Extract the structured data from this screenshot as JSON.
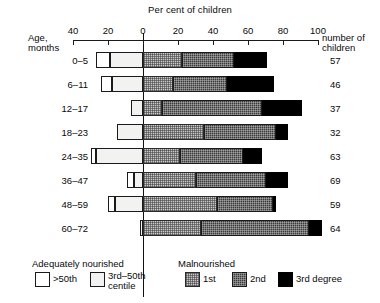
{
  "chart_title": "Per cent of children",
  "axis": {
    "ticks": [
      "40",
      "20",
      "0",
      "20",
      "40",
      "60",
      "80",
      "100"
    ]
  },
  "headers": {
    "age_line1": "Age,",
    "age_line2": "months",
    "count_line1": "number of",
    "count_line2": "children"
  },
  "legend": {
    "left_title": "Adequately nourished",
    "right_title": "Malnourished",
    "items": [
      {
        "label": ">50th",
        "label2": "",
        "swatch": "over50"
      },
      {
        "label": "3rd–50th",
        "label2": "centile",
        "swatch": "third50"
      },
      {
        "label": "1st",
        "label2": "",
        "swatch": "deg1"
      },
      {
        "label": "2nd",
        "label2": "",
        "swatch": "deg2"
      },
      {
        "label": "3rd degree",
        "label2": "",
        "swatch": "deg3"
      }
    ]
  },
  "chart_data": {
    "type": "bar",
    "orientation": "horizontal",
    "subtype": "diverging-stacked",
    "title": "Per cent of children",
    "xlabel": "Per cent of children",
    "ylabel": "Age, months",
    "xlim": [
      -50,
      100
    ],
    "xticks": [
      -40,
      -20,
      0,
      20,
      40,
      60,
      80,
      100
    ],
    "xticklabels": [
      "40",
      "20",
      "0",
      "20",
      "40",
      "60",
      "80",
      "100"
    ],
    "grid": false,
    "legend_position": "bottom",
    "categories": [
      "0–5",
      "6–11",
      "12–17",
      "18–23",
      "24–35",
      "36–47",
      "48–59",
      "60–72"
    ],
    "counts": [
      57,
      46,
      37,
      32,
      63,
      69,
      59,
      64
    ],
    "series": [
      {
        "name": ">50th",
        "direction": "left",
        "values": [
          8,
          6,
          0,
          0,
          3,
          4,
          4,
          0
        ]
      },
      {
        "name": "3rd–50th",
        "direction": "left",
        "values": [
          19,
          18,
          7,
          15,
          27,
          5,
          16,
          2
        ]
      },
      {
        "name": "1st",
        "direction": "right",
        "values": [
          22,
          17,
          11,
          35,
          21,
          30,
          42,
          33
        ]
      },
      {
        "name": "2nd",
        "direction": "right",
        "values": [
          30,
          31,
          57,
          41,
          36,
          40,
          32,
          62
        ]
      },
      {
        "name": "3rd degree",
        "direction": "right",
        "values": [
          19,
          27,
          23,
          7,
          11,
          13,
          2,
          7
        ]
      }
    ]
  }
}
